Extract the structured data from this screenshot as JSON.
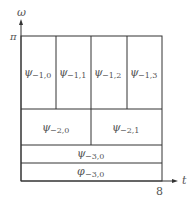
{
  "axes": {
    "y_label": "ω",
    "y_tick": "π",
    "x_label": "t",
    "x_tick": "8"
  },
  "tiling": {
    "rows": [
      {
        "level": "-1",
        "cells": [
          {
            "symbol": "ψ",
            "sub": "−1,0"
          },
          {
            "symbol": "ψ",
            "sub": "−1,1"
          },
          {
            "symbol": "ψ",
            "sub": "−1,2"
          },
          {
            "symbol": "ψ",
            "sub": "−1,3"
          }
        ]
      },
      {
        "level": "-2",
        "cells": [
          {
            "symbol": "ψ",
            "sub": "−2,0"
          },
          {
            "symbol": "ψ",
            "sub": "−2,1"
          }
        ]
      },
      {
        "level": "-3",
        "cells": [
          {
            "symbol": "ψ",
            "sub": "−3,0"
          }
        ]
      },
      {
        "level": "-3-scaling",
        "cells": [
          {
            "symbol": "φ",
            "sub": "−3,0"
          }
        ]
      }
    ]
  },
  "colors": {
    "line": "#333333",
    "text": "#555555",
    "background": "#ffffff"
  }
}
